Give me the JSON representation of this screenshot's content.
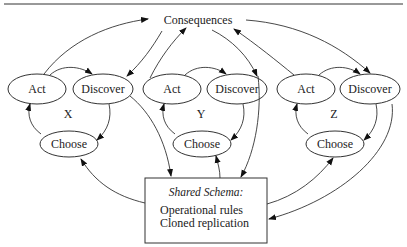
{
  "diagram": {
    "top_node": "Consequences",
    "groups": [
      {
        "label": "X",
        "act": "Act",
        "discover": "Discover",
        "choose": "Choose"
      },
      {
        "label": "Y",
        "act": "Act",
        "discover": "Discover",
        "choose": "Choose"
      },
      {
        "label": "Z",
        "act": "Act",
        "discover": "Discover",
        "choose": "Choose"
      }
    ],
    "schema_box": {
      "title": "Shared Schema:",
      "lines": [
        "Operational rules",
        "Cloned replication"
      ]
    },
    "colors": {
      "stroke": "#333333",
      "background": "#ffffff",
      "text": "#222222"
    }
  }
}
